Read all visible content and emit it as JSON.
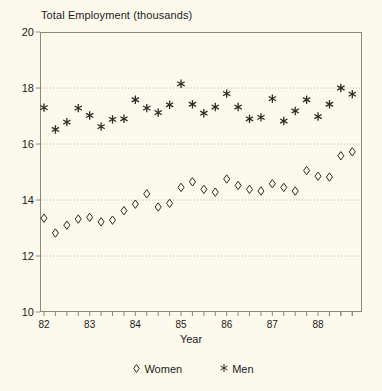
{
  "chart_data": {
    "type": "scatter",
    "title": "Total Employment (thousands)",
    "xlabel": "Year",
    "ylabel": "",
    "ylim": [
      10,
      20
    ],
    "xlim": [
      1982.0,
      1988.875
    ],
    "yticks": [
      10,
      12,
      14,
      16,
      18,
      20
    ],
    "ytick_labels": [
      "10",
      "12",
      "14",
      "16",
      "18",
      "20"
    ],
    "xticks": [
      82,
      83,
      84,
      85,
      86,
      87,
      88
    ],
    "xtick_labels": [
      "82",
      "83",
      "84",
      "85",
      "86",
      "87",
      "88"
    ],
    "minor_xticks_per_year": 4,
    "grid": "horizontal-dotted",
    "legend_position": "bottom-center",
    "x": [
      1982.0,
      1982.25,
      1982.5,
      1982.75,
      1983.0,
      1983.25,
      1983.5,
      1983.75,
      1984.0,
      1984.25,
      1984.5,
      1984.75,
      1985.0,
      1985.25,
      1985.5,
      1985.75,
      1986.0,
      1986.25,
      1986.5,
      1986.75,
      1987.0,
      1987.25,
      1987.5,
      1987.75,
      1988.0,
      1988.25,
      1988.5,
      1988.75
    ],
    "series": [
      {
        "name": "Women",
        "marker": "diamond",
        "values": [
          13.35,
          12.82,
          13.1,
          13.32,
          13.38,
          13.22,
          13.28,
          13.62,
          13.85,
          14.22,
          13.75,
          13.88,
          14.45,
          14.65,
          14.38,
          14.28,
          14.75,
          14.52,
          14.38,
          14.32,
          14.58,
          14.45,
          14.32,
          15.05,
          14.85,
          14.82,
          15.58,
          15.72
        ]
      },
      {
        "name": "Men",
        "marker": "asterisk",
        "values": [
          17.3,
          16.52,
          16.78,
          17.28,
          17.02,
          16.62,
          16.88,
          16.9,
          17.58,
          17.28,
          17.12,
          17.4,
          18.15,
          17.42,
          17.1,
          17.32,
          17.8,
          17.32,
          16.9,
          16.95,
          17.62,
          16.82,
          17.18,
          17.58,
          16.98,
          17.42,
          18.0,
          17.78
        ]
      }
    ]
  },
  "legend": {
    "women_symbol": "diamond-marker",
    "women_label": "Women",
    "men_symbol": "asterisk-marker",
    "men_label": "Men"
  },
  "colors": {
    "background": "#fbfaec",
    "axis": "#8a8a7a",
    "marker": "#2b2b26",
    "grid": "#b8b8a8",
    "text": "#1b1b1b"
  }
}
